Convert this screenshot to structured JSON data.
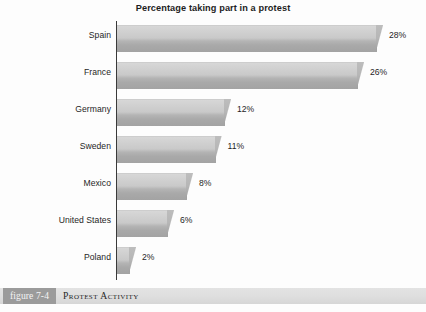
{
  "chart_data": {
    "type": "bar",
    "orientation": "horizontal",
    "title": "Percentage taking part in a protest",
    "xlabel": "",
    "ylabel": "",
    "xlim": [
      0,
      28
    ],
    "grid": false,
    "legend": null,
    "categories": [
      "Spain",
      "France",
      "Germany",
      "Sweden",
      "Mexico",
      "United States",
      "Poland"
    ],
    "values": [
      28,
      26,
      12,
      11,
      8,
      6,
      2
    ],
    "data_labels": [
      "28%",
      "26%",
      "12%",
      "11%",
      "8%",
      "6%",
      "2%"
    ],
    "series": [
      {
        "name": "Percentage taking part in a protest",
        "values": [
          28,
          26,
          12,
          11,
          8,
          6,
          2
        ]
      }
    ],
    "annotations": []
  },
  "caption": {
    "tag": "figure 7-4",
    "text": "Protest Activity"
  },
  "colors": {
    "bar_light": "#d7d7d7",
    "bar_dark": "#a3a3a3",
    "axis": "#3a3a3a",
    "caption_band": "#dedede",
    "caption_tag_bg": "#9b9b9b",
    "text": "#1f1f1f"
  },
  "scale": {
    "px_per_percent": 9.5,
    "axis_x_px": 117
  }
}
